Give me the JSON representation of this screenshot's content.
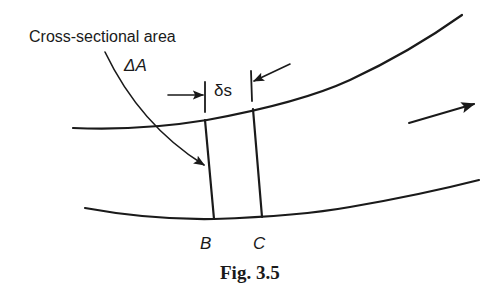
{
  "figure": {
    "caption": "Fig. 3.5",
    "colors": {
      "ink": "#1a1a1a",
      "background": "#ffffff"
    }
  },
  "labels": {
    "area_label": "Cross-sectional area",
    "area_symbol": "ΔA",
    "length_symbol": "δs",
    "section_b": "B",
    "section_c": "C"
  },
  "elements": {
    "upper_wall": "streamtube-upper-boundary",
    "lower_wall": "streamtube-lower-boundary",
    "section_lines": [
      "B",
      "C"
    ],
    "flow_direction": "left-to-right"
  }
}
